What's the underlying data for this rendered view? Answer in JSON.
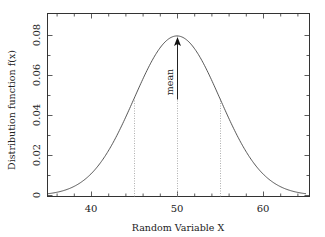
{
  "chart_data": {
    "type": "line",
    "title": "",
    "xlabel": "Random Variable X",
    "ylabel": "Distribution function f(x)",
    "xlim": [
      35,
      65
    ],
    "ylim": [
      0,
      0.09
    ],
    "x_ticks": [
      40,
      50,
      60
    ],
    "x_tick_labels": [
      "40",
      "50",
      "60"
    ],
    "y_ticks": [
      0,
      0.02,
      0.04,
      0.06,
      0.08
    ],
    "y_tick_labels": [
      "0",
      "0.02",
      "0.04",
      "0.06",
      "0.08"
    ],
    "grid": false,
    "legend": null,
    "series": [
      {
        "name": "Normal distribution (mean 50, sigma 5)",
        "mean": 50,
        "sigma": 5,
        "x": [
          35,
          37,
          39,
          41,
          43,
          45,
          47,
          49,
          50,
          51,
          53,
          55,
          57,
          59,
          61,
          63,
          65
        ],
        "y": [
          0.0009,
          0.0028,
          0.0071,
          0.0158,
          0.03,
          0.0484,
          0.0666,
          0.0782,
          0.0798,
          0.0782,
          0.0666,
          0.0484,
          0.03,
          0.0158,
          0.0071,
          0.0028,
          0.0009
        ]
      }
    ],
    "annotations": [
      {
        "type": "arrow",
        "text": "mean",
        "x": 50,
        "y_from": 0.048,
        "y_to": 0.0798
      },
      {
        "type": "vline-dotted",
        "x": 45,
        "y_to": 0.0484
      },
      {
        "type": "vline-dotted",
        "x": 50,
        "y_to": 0.0798
      },
      {
        "type": "vline-dotted",
        "x": 55,
        "y_to": 0.0484
      }
    ]
  },
  "labels": {
    "xlabel": "Random Variable X",
    "ylabel": "Distribution function f(x)",
    "mean": "mean",
    "xt0": "40",
    "xt1": "50",
    "xt2": "60",
    "yt0": "0",
    "yt1": "0.02",
    "yt2": "0.04",
    "yt3": "0.06",
    "yt4": "0.08"
  },
  "colors": {
    "curve": "#444444",
    "frame": "#333333",
    "dotted": "#999999"
  }
}
